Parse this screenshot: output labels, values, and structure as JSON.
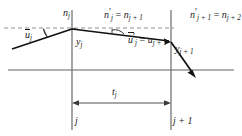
{
  "figure": {
    "type": "optical-ray-trace-diagram",
    "colors": {
      "ink": "#1a1a1a",
      "axis": "#5a5a5a",
      "surface": "#6a6a6a",
      "dashed": "#8a8a8a",
      "ray": "#111111",
      "background": "#ffffff"
    },
    "labels": {
      "n_j": "n",
      "n_j_sub": "j",
      "np_j": "n",
      "np_j_sub": "j",
      "np_j_rhs": "n",
      "np_j_rhs_sub": "j + 1",
      "np_jp1": "n",
      "np_jp1_sub": "j + 1",
      "np_jp1_rhs": "n",
      "np_jp1_rhs_sub": "j + 2",
      "u_j": "u",
      "u_j_sub": "j",
      "up_j": "u",
      "up_j_sub": "j",
      "up_j_rhs": "u",
      "up_j_rhs_sub": "j + 1",
      "y_j": "y",
      "y_j_sub": "j",
      "y_jp1": "y",
      "y_jp1_sub": "j + 1",
      "t_j": "t",
      "t_j_sub": "j",
      "axis_j": "j",
      "axis_jp1": "j + 1",
      "equals": "=",
      "prime": "′"
    },
    "geometry": {
      "surface_j_x": 72,
      "surface_jp1_x": 171,
      "optical_axis_y": 70,
      "dashed_line_y": 28,
      "ray_in_start": [
        12,
        49
      ],
      "ray_vertex_j": [
        72,
        29
      ],
      "ray_vertex_jp1": [
        171,
        42
      ],
      "ray_out_end": [
        196,
        76
      ],
      "dimension_arrow_y": 103,
      "dimension_from_x": 72,
      "dimension_to_x": 171
    }
  }
}
